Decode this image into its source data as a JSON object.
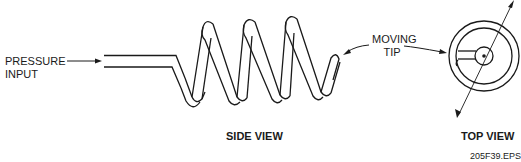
{
  "diagram": {
    "labels": {
      "pressure_input_line1": "PRESSURE",
      "pressure_input_line2": "INPUT",
      "moving_tip_line1": "MOVING",
      "moving_tip_line2": "TIP",
      "side_view": "SIDE VIEW",
      "top_view": "TOP VIEW",
      "figure_id": "205F39.EPS"
    },
    "components": [
      "pressure-input-tube",
      "helical-coil",
      "moving-tip",
      "top-view-dial",
      "pointer"
    ],
    "colors": {
      "stroke": "#1a1a1a",
      "background": "#ffffff"
    }
  }
}
